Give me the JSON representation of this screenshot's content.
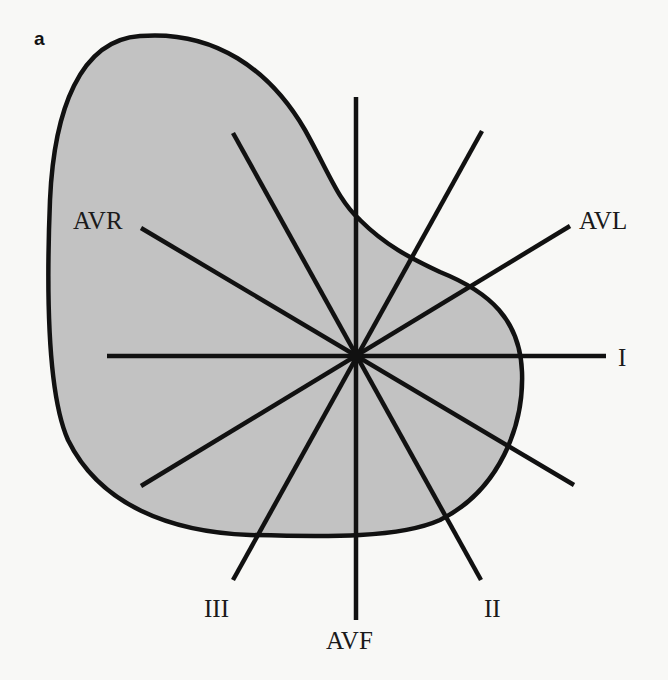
{
  "figure": {
    "panel_label": "a",
    "colors": {
      "background": "#f8f8f6",
      "heart_fill": "#c2c2c2",
      "outline": "#111111",
      "lead_lines": "#111111"
    },
    "center": {
      "x": 356,
      "y": 356
    },
    "leads": [
      {
        "name": "I",
        "label": "I",
        "angle_deg": 0,
        "x1": 107,
        "y1": 356,
        "x2": 606,
        "y2": 356
      },
      {
        "name": "II",
        "label": "II",
        "angle_deg": 60,
        "x1": 233,
        "y1": 133,
        "x2": 481,
        "y2": 580
      },
      {
        "name": "III",
        "label": "III",
        "angle_deg": 120,
        "x1": 482,
        "y1": 131,
        "x2": 233,
        "y2": 580
      },
      {
        "name": "AVF",
        "label": "AVF",
        "angle_deg": 90,
        "x1": 356,
        "y1": 97,
        "x2": 356,
        "y2": 620
      },
      {
        "name": "AVR",
        "label": "AVR",
        "angle_deg": -150,
        "x1": 141,
        "y1": 228,
        "x2": 574,
        "y2": 485
      },
      {
        "name": "AVL",
        "label": "AVL",
        "angle_deg": -30,
        "x1": 570,
        "y1": 226,
        "x2": 141,
        "y2": 486
      }
    ],
    "labels": {
      "I": "I",
      "II": "II",
      "III": "III",
      "AVF": "AVF",
      "AVR": "AVR",
      "AVL": "AVL"
    }
  }
}
